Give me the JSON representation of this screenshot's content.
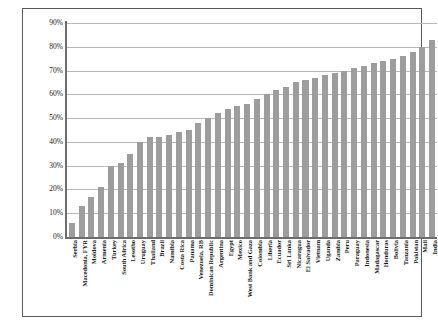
{
  "chart_data": {
    "type": "bar",
    "title": "",
    "subtitle": "",
    "xlabel": "",
    "ylabel": "",
    "ylim": [
      0,
      90
    ],
    "ytick_labels": [
      "90%",
      "80%",
      "70%",
      "60%",
      "50%",
      "40%",
      "30%",
      "20%",
      "10%",
      "0%"
    ],
    "ytick_values": [
      90,
      80,
      70,
      60,
      50,
      40,
      30,
      20,
      10,
      0
    ],
    "grid": true,
    "legend": "none",
    "bar_color": "#9d9d9d",
    "axis_color": "#6d6d6d",
    "gridline_color": "#b9b9b9",
    "categories": [
      "Serbia",
      "Macedonia, FYR",
      "Moldova",
      "Armenia",
      "Turkey",
      "South Africa",
      "Lesotho",
      "Uruguay",
      "Thailand",
      "Brazil",
      "Namibia",
      "Costa Rica",
      "Panama",
      "Venezuela, RB",
      "Dominican Republic",
      "Argentina",
      "Egypt",
      "Mexico",
      "West Bank and Gaza",
      "Colombia",
      "Liberia",
      "Ecuador",
      "Sri Lanka",
      "Nicaragua",
      "El Salvador",
      "Vietnam",
      "Uganda",
      "Zambia",
      "Peru",
      "Paraguay",
      "Indonesia",
      "Madagascar",
      "Honduras",
      "Bolivia",
      "Tanzania",
      "Pakistan",
      "Mali",
      "India"
    ],
    "values": [
      6,
      13,
      17,
      21,
      30,
      31,
      35,
      40,
      42,
      42,
      43,
      44,
      45,
      48,
      50,
      52,
      54,
      55,
      56,
      58,
      60,
      62,
      63,
      65,
      66,
      67,
      68,
      69,
      70,
      71,
      72,
      73,
      74,
      75,
      76,
      78,
      80,
      83
    ]
  }
}
